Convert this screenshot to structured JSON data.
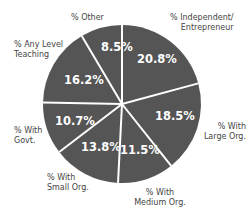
{
  "chart_data": {
    "type": "pie",
    "title": "",
    "slices": [
      {
        "label": "% Independent/ Entrepreneur",
        "value": 20.8,
        "display": "20.8%"
      },
      {
        "label": "% With Large Org.",
        "value": 18.5,
        "display": "18.5%"
      },
      {
        "label": "% With Medium Org.",
        "value": 11.5,
        "display": "11.5%"
      },
      {
        "label": "% With Small Org.",
        "value": 13.8,
        "display": "13.8%"
      },
      {
        "label": "% With Govt.",
        "value": 10.7,
        "display": "10.7%"
      },
      {
        "label": "% Any Level Teaching",
        "value": 16.2,
        "display": "16.2%"
      },
      {
        "label": "% Other",
        "value": 8.5,
        "display": "8.5%"
      }
    ],
    "start_angle_deg": 0,
    "direction": "clockwise",
    "slice_color": "#555555",
    "separator_color": "#ffffff",
    "legend": "none"
  },
  "labels": {
    "independent_1": "% Independent/",
    "independent_2": "Entrepreneur",
    "large_1": "% With",
    "large_2": "Large Org.",
    "medium_1": "% With",
    "medium_2": "Medium Org.",
    "small_1": "% With",
    "small_2": "Small Org.",
    "govt_1": "% With",
    "govt_2": "Govt.",
    "teaching_1": "% Any Level",
    "teaching_2": "Teaching",
    "other": "% Other"
  },
  "values": {
    "independent": "20.8%",
    "large": "18.5%",
    "medium": "11.5%",
    "small": "13.8%",
    "govt": "10.7%",
    "teaching": "16.2%",
    "other": "8.5%"
  }
}
